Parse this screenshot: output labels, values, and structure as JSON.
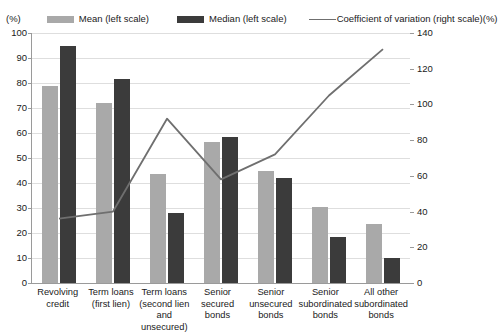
{
  "legend": {
    "left_unit": "(%)",
    "right_unit": "(%)",
    "items": [
      {
        "label": "Mean (left scale)",
        "key": "mean-swatch",
        "color": "#a9a9a9"
      },
      {
        "label": "Median  (left scale)",
        "key": "median-swatch",
        "color": "#3b3b3b"
      },
      {
        "label": "Coefficient of variation (right scale)",
        "key": "cov-line-key",
        "color": "#6f6f6f"
      }
    ]
  },
  "axes": {
    "left_ticks": [
      "100",
      "90",
      "80",
      "70",
      "60",
      "50",
      "40",
      "30",
      "20",
      "10",
      "0"
    ],
    "right_ticks": [
      "140",
      "120",
      "100",
      "80",
      "60",
      "40",
      "20",
      "0"
    ]
  },
  "chart_data": {
    "type": "bar",
    "title": "",
    "subtitle": "",
    "xlabel": "",
    "ylabel": "(%)",
    "y2label": "(%)",
    "ylim": [
      0,
      100
    ],
    "y2lim": [
      0,
      140
    ],
    "grid": true,
    "legend_position": "top",
    "categories": [
      "Revolving credit",
      "Term loans (first lien)",
      "Term loans (second lien and unsecured)",
      "Senior secured bonds",
      "Senior unsecured bonds",
      "Senior subordinated bonds",
      "All other subordinated bonds"
    ],
    "category_lines": [
      [
        "Revolving",
        "credit"
      ],
      [
        "Term loans",
        "(first lien)"
      ],
      [
        "Term loans",
        "(second lien",
        "and unsecured)"
      ],
      [
        "Senior",
        "secured",
        "bonds"
      ],
      [
        "Senior",
        "unsecured",
        "bonds"
      ],
      [
        "Senior",
        "subordinated",
        "bonds"
      ],
      [
        "All other",
        "subordinated",
        "bonds"
      ]
    ],
    "series": [
      {
        "name": "Mean (left scale)",
        "axis": "left",
        "type": "bar",
        "color": "#a9a9a9",
        "values": [
          79.0,
          72.0,
          43.5,
          56.5,
          45.0,
          30.5,
          23.5
        ]
      },
      {
        "name": "Median  (left scale)",
        "axis": "left",
        "type": "bar",
        "color": "#3b3b3b",
        "values": [
          95.0,
          81.5,
          28.0,
          58.5,
          42.0,
          18.5,
          10.0
        ]
      },
      {
        "name": "Coefficient of variation (right scale)",
        "axis": "right",
        "type": "line",
        "color": "#6f6f6f",
        "values": [
          36.0,
          40.0,
          92.0,
          58.0,
          72.0,
          105.0,
          131.0
        ]
      }
    ]
  }
}
